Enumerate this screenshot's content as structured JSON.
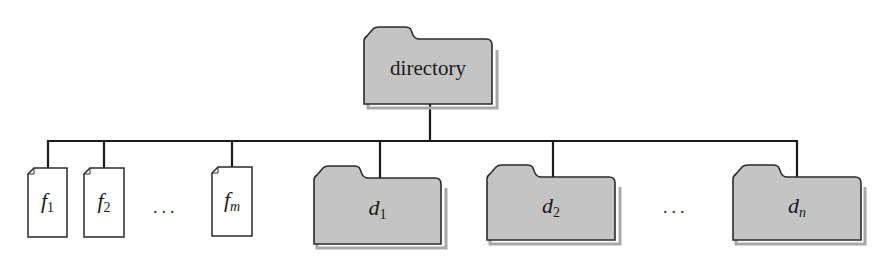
{
  "diagram": {
    "colors": {
      "folder_fill": "#c4c4c4",
      "folder_stroke": "#2a2a2a",
      "file_fill": "#ffffff",
      "line": "#1a1a1a",
      "shadow": "#9a9a9a"
    },
    "root": {
      "label": "directory",
      "type": "folder"
    },
    "children": [
      {
        "type": "file",
        "base": "f",
        "sub": "1"
      },
      {
        "type": "file",
        "base": "f",
        "sub": "2"
      },
      {
        "type": "ellipsis",
        "text": "..."
      },
      {
        "type": "file",
        "base": "f",
        "sub": "m"
      },
      {
        "type": "folder",
        "base": "d",
        "sub": "1"
      },
      {
        "type": "folder",
        "base": "d",
        "sub": "2"
      },
      {
        "type": "ellipsis",
        "text": "..."
      },
      {
        "type": "folder",
        "base": "d",
        "sub": "n"
      }
    ]
  }
}
